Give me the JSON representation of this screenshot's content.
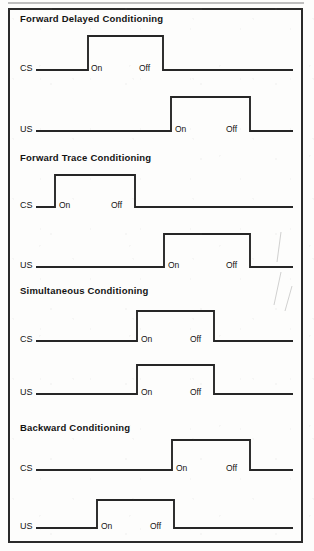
{
  "figure": {
    "title_hidden": "Classical conditioning CS-US timing arrangements",
    "trace_color": "#262626",
    "border_color": "#2b2b2b",
    "background_color": "#fdfdfc",
    "on_label": "On",
    "off_label": "Off",
    "cs_label": "CS",
    "us_label": "US"
  },
  "chart_data": {
    "type": "line",
    "xlabel": "Time",
    "ylabel": "Stimulus state (off/on)",
    "xlim": [
      0,
      295
    ],
    "ylim": [
      0,
      1
    ],
    "grid": false,
    "legend": "none",
    "axis_note": "Each trace is a square wave: baseline = stimulus off, raised level = stimulus on. X positions are in figure pixel units.",
    "panels": [
      {
        "name": "Forward Delayed Conditioning",
        "title": "Forward Delayed Conditioning",
        "title_x": 20,
        "title_y": 22,
        "traces": [
          {
            "name": "CS",
            "label": "CS",
            "label_x": 20,
            "baseline_y": 70,
            "top_y": 36,
            "start_x": 36,
            "end_x": 293,
            "on_x": 88,
            "off_x": 163,
            "on_label_x": 91,
            "off_label_x": 139,
            "label_text_y": 71
          },
          {
            "name": "US",
            "label": "US",
            "label_x": 20,
            "baseline_y": 131,
            "top_y": 97,
            "start_x": 36,
            "end_x": 293,
            "on_x": 171,
            "off_x": 250,
            "on_label_x": 175,
            "off_label_x": 226,
            "label_text_y": 132
          }
        ]
      },
      {
        "name": "Forward Trace Conditioning",
        "title": "Forward Trace Conditioning",
        "title_x": 20,
        "title_y": 161,
        "traces": [
          {
            "name": "CS",
            "label": "CS",
            "label_x": 20,
            "baseline_y": 207,
            "top_y": 175,
            "start_x": 36,
            "end_x": 293,
            "on_x": 55,
            "off_x": 135,
            "on_label_x": 59,
            "off_label_x": 111,
            "label_text_y": 208
          },
          {
            "name": "US",
            "label": "US",
            "label_x": 20,
            "baseline_y": 267,
            "top_y": 234,
            "start_x": 36,
            "end_x": 293,
            "on_x": 164,
            "off_x": 250,
            "on_label_x": 168,
            "off_label_x": 226,
            "label_text_y": 268
          }
        ]
      },
      {
        "name": "Simultaneous Conditioning",
        "title": "Simultaneous Conditioning",
        "title_x": 20,
        "title_y": 294,
        "traces": [
          {
            "name": "CS",
            "label": "CS",
            "label_x": 20,
            "baseline_y": 341,
            "top_y": 311,
            "start_x": 36,
            "end_x": 293,
            "on_x": 137,
            "off_x": 214,
            "on_label_x": 141,
            "off_label_x": 190,
            "label_text_y": 342
          },
          {
            "name": "US",
            "label": "US",
            "label_x": 20,
            "baseline_y": 394,
            "top_y": 365,
            "start_x": 36,
            "end_x": 293,
            "on_x": 137,
            "off_x": 214,
            "on_label_x": 141,
            "off_label_x": 190,
            "label_text_y": 395
          }
        ]
      },
      {
        "name": "Backward Conditioning",
        "title": "Backward Conditioning",
        "title_x": 20,
        "title_y": 431,
        "traces": [
          {
            "name": "CS",
            "label": "CS",
            "label_x": 20,
            "baseline_y": 470,
            "top_y": 440,
            "start_x": 36,
            "end_x": 293,
            "on_x": 172,
            "off_x": 250,
            "on_label_x": 176,
            "off_label_x": 226,
            "label_text_y": 471
          },
          {
            "name": "US",
            "label": "US",
            "label_x": 20,
            "baseline_y": 528,
            "top_y": 500,
            "start_x": 36,
            "end_x": 293,
            "on_x": 97,
            "off_x": 174,
            "on_label_x": 101,
            "off_label_x": 150,
            "label_text_y": 529
          }
        ]
      }
    ]
  }
}
